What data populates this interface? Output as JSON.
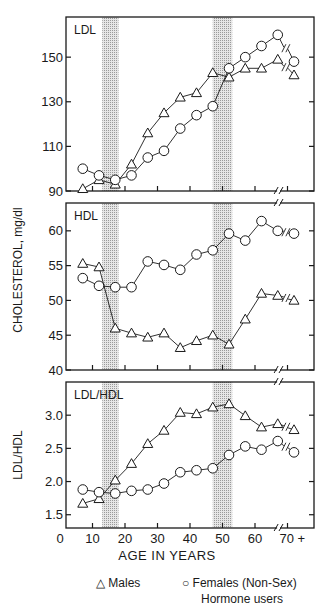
{
  "chart_data": {
    "type": "line",
    "title": "",
    "xlabel": "AGE IN YEARS",
    "ylabel": "CHOLESTEROL, mg/dl",
    "x_ticks": [
      "0",
      "10",
      "20",
      "30",
      "40",
      "50",
      "60",
      "70 +"
    ],
    "x": [
      7,
      12,
      17,
      22,
      27,
      32,
      37,
      42,
      47,
      52,
      57,
      62,
      67,
      72
    ],
    "shaded_age_bands": [
      [
        13,
        18
      ],
      [
        47,
        53
      ]
    ],
    "legend": {
      "males": "Males",
      "females_line1": "Females (Non-Sex)",
      "females_line2": "Hormone users"
    },
    "panels": [
      {
        "label": "LDL",
        "ylim": [
          90,
          168
        ],
        "y_ticks": [
          90,
          110,
          130,
          150
        ],
        "series": [
          {
            "name": "Males",
            "marker": "triangle",
            "values": [
              91,
              95,
              93,
              102,
              116,
              125,
              132,
              134,
              143,
              141,
              145,
              145,
              149,
              142
            ]
          },
          {
            "name": "Females (Non-Sex) Hormone users",
            "marker": "circle",
            "values": [
              100,
              97,
              95,
              97,
              105,
              108,
              118,
              124,
              128,
              145,
              150,
              155,
              160,
              148
            ]
          }
        ]
      },
      {
        "label": "HDL",
        "ylim": [
          40,
          64
        ],
        "y_ticks": [
          40,
          45,
          50,
          55,
          60
        ],
        "series": [
          {
            "name": "Males",
            "marker": "triangle",
            "values": [
              55.3,
              54.8,
              46,
              45.3,
              44.7,
              45.3,
              43.2,
              44.2,
              45,
              43.7,
              47.3,
              51,
              50.7,
              50
            ]
          },
          {
            "name": "Females (Non-Sex) Hormone users",
            "marker": "circle",
            "values": [
              53.2,
              52.1,
              51.9,
              51.9,
              55.6,
              55.1,
              54.4,
              56.6,
              57.2,
              59.6,
              58.6,
              61.4,
              60,
              59.6
            ]
          }
        ]
      },
      {
        "label": "LDL/HDL",
        "ylim": [
          1.3,
          3.5
        ],
        "y_ticks": [
          "1.5",
          "2.0",
          "2.5",
          "3.0"
        ],
        "series": [
          {
            "name": "Males",
            "marker": "triangle",
            "values": [
              1.67,
              1.74,
              2.02,
              2.27,
              2.57,
              2.77,
              3.04,
              3.02,
              3.12,
              3.17,
              2.99,
              2.82,
              2.87,
              2.78
            ]
          },
          {
            "name": "Females (Non-Sex) Hormone users",
            "marker": "circle",
            "values": [
              1.88,
              1.84,
              1.82,
              1.86,
              1.88,
              1.97,
              2.14,
              2.17,
              2.2,
              2.4,
              2.53,
              2.48,
              2.61,
              2.44
            ]
          }
        ]
      }
    ],
    "grid": false
  },
  "labels": {
    "xlabel": "AGE IN YEARS",
    "ylabel": "CHOLESTEROL,  mg/dl",
    "ldl_hdl_ylabel": "LDL/HDL",
    "legend_males": "Males",
    "legend_females_1": "Females (Non-Sex)",
    "legend_females_2": "Hormone users",
    "legend_tri": "△",
    "legend_circ": "○"
  }
}
